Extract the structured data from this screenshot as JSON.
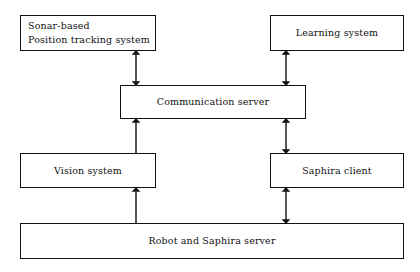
{
  "diagram": {
    "type": "block-diagram",
    "style": {
      "background": "#ffffff",
      "line_color": "#111111",
      "text_color": "#111111",
      "box_fill": "#ffffff"
    },
    "nodes": [
      {
        "id": "sonar",
        "label": "Sonar-based\nPosition tracking system",
        "align": "left",
        "x": 20,
        "y": 15,
        "w": 136,
        "h": 36
      },
      {
        "id": "learning",
        "label": "Learning system",
        "align": "center",
        "x": 270,
        "y": 15,
        "w": 134,
        "h": 36
      },
      {
        "id": "comm-server",
        "label": "Communication server",
        "align": "center",
        "x": 120,
        "y": 85,
        "w": 186,
        "h": 34
      },
      {
        "id": "vision",
        "label": "Vision system",
        "align": "center",
        "x": 20,
        "y": 153,
        "w": 136,
        "h": 35
      },
      {
        "id": "saphira-client",
        "label": "Saphira client",
        "align": "center",
        "x": 270,
        "y": 153,
        "w": 134,
        "h": 35
      },
      {
        "id": "robot-server",
        "label": "Robot and Saphira server",
        "align": "center",
        "x": 20,
        "y": 223,
        "w": 384,
        "h": 36
      }
    ],
    "connections": [
      {
        "id": "comm-to-sonar",
        "from": "comm-server",
        "to": "sonar",
        "heads": "both",
        "orientation": "vertical",
        "x": 136,
        "y1": 51,
        "y2": 85
      },
      {
        "id": "comm-to-learning",
        "from": "comm-server",
        "to": "learning",
        "heads": "both",
        "orientation": "vertical",
        "x": 286,
        "y1": 51,
        "y2": 85
      },
      {
        "id": "vision-to-comm",
        "from": "vision",
        "to": "comm-server",
        "heads": "up",
        "orientation": "vertical",
        "x": 136,
        "y1": 119,
        "y2": 153
      },
      {
        "id": "comm-to-saphira-client",
        "from": "comm-server",
        "to": "saphira-client",
        "heads": "both",
        "orientation": "vertical",
        "x": 286,
        "y1": 119,
        "y2": 153
      },
      {
        "id": "robot-to-vision",
        "from": "robot-server",
        "to": "vision",
        "heads": "up",
        "orientation": "vertical",
        "x": 136,
        "y1": 188,
        "y2": 223
      },
      {
        "id": "saphira-client-to-robot",
        "from": "saphira-client",
        "to": "robot-server",
        "heads": "both",
        "orientation": "vertical",
        "x": 286,
        "y1": 188,
        "y2": 223
      }
    ]
  }
}
